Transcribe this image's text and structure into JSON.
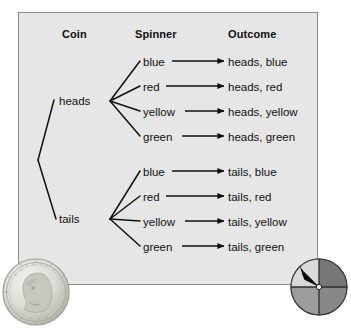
{
  "diagram": {
    "title_columns": {
      "coin": "Coin",
      "spinner": "Spinner",
      "outcome": "Outcome"
    },
    "colors": {
      "panel_background": "#e6e6e6",
      "panel_border": "#8b8b8b",
      "line": "#111111",
      "text": "#111111",
      "page_background": "#ffffff"
    },
    "coin_branches": [
      {
        "label": "heads"
      },
      {
        "label": "tails"
      }
    ],
    "spinner_colors": [
      "blue",
      "red",
      "yellow",
      "green"
    ],
    "rows": [
      {
        "coin": "heads",
        "spinner": "blue",
        "outcome": "heads, blue"
      },
      {
        "coin": "heads",
        "spinner": "red",
        "outcome": "heads, red"
      },
      {
        "coin": "heads",
        "spinner": "yellow",
        "outcome": "heads, yellow"
      },
      {
        "coin": "heads",
        "spinner": "green",
        "outcome": "heads, green"
      },
      {
        "coin": "tails",
        "spinner": "blue",
        "outcome": "tails, blue"
      },
      {
        "coin": "tails",
        "spinner": "red",
        "outcome": "tails, red"
      },
      {
        "coin": "tails",
        "spinner": "yellow",
        "outcome": "tails, yellow"
      },
      {
        "coin": "tails",
        "spinner": "green",
        "outcome": "tails, green"
      }
    ],
    "illustrations": {
      "coin": {
        "name": "us-quarter-coin",
        "description": "quarter"
      },
      "spinner": {
        "name": "four-sector-spinner",
        "description": "spinner",
        "sectors": [
          {
            "position": "top-left",
            "shade": "#d9d9d9"
          },
          {
            "position": "top-right",
            "shade": "#777777"
          },
          {
            "position": "bottom-left",
            "shade": "#9c9c9c"
          },
          {
            "position": "bottom-right",
            "shade": "#888888"
          }
        ],
        "pointer_direction": "up-left"
      }
    }
  }
}
